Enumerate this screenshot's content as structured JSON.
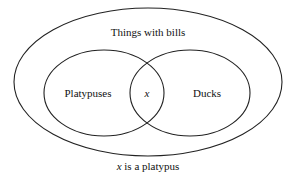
{
  "diagram": {
    "type": "venn",
    "outer_set": {
      "label": "Things with bills"
    },
    "sets": [
      {
        "label": "Platypuses"
      },
      {
        "label": "Ducks"
      }
    ],
    "intersection": {
      "label": "x"
    },
    "caption": {
      "variable": "x",
      "text": " is a platypus"
    },
    "colors": {
      "stroke": "#222222",
      "text": "#111111",
      "background": "#ffffff"
    }
  }
}
